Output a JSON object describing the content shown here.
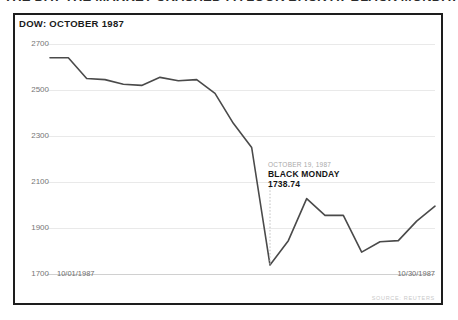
{
  "clipped_headline": "THE DAY THE MARKET CRASHED : A LOOK BACK AT BLACK MONDAY",
  "chart_title": "DOW: OCTOBER 1987",
  "source_credit": "SOURCE: REUTERS",
  "annotation": {
    "date": "OCTOBER 19, 1987",
    "title": "BLACK MONDAY",
    "value": "1738.74"
  },
  "axis": {
    "x_start_label": "10/01/1987",
    "x_end_label": "10/30/1987"
  },
  "colors": {
    "line": "#4a4a4a",
    "frame": "#1d1d1d",
    "grid": "#e9e9e9",
    "tick_text": "#767676",
    "annotation_date": "#a9a9a9",
    "annotation_text": "#151515",
    "source_text": "#c9c9c9"
  },
  "chart_data": {
    "type": "line",
    "title": "DOW: OCTOBER 1987",
    "xlabel": "",
    "ylabel": "",
    "ylim": [
      1700,
      2700
    ],
    "yticks": [
      2700,
      2500,
      2300,
      2100,
      1900,
      1700
    ],
    "grid": true,
    "legend": null,
    "x": [
      "10/01/1987",
      "10/02/1987",
      "10/05/1987",
      "10/06/1987",
      "10/07/1987",
      "10/08/1987",
      "10/09/1987",
      "10/12/1987",
      "10/13/1987",
      "10/14/1987",
      "10/15/1987",
      "10/16/1987",
      "10/19/1987",
      "10/20/1987",
      "10/21/1987",
      "10/22/1987",
      "10/23/1987",
      "10/26/1987",
      "10/27/1987",
      "10/28/1987",
      "10/29/1987",
      "10/30/1987"
    ],
    "values": [
      2640,
      2640,
      2550,
      2545,
      2525,
      2520,
      2555,
      2540,
      2545,
      2485,
      2355,
      2250,
      1739,
      1845,
      2028,
      1955,
      1955,
      1795,
      1840,
      1845,
      1930,
      1995
    ],
    "annotations": [
      {
        "x": "10/19/1987",
        "y": 1738.74,
        "date_label": "OCTOBER 19, 1987",
        "title": "BLACK MONDAY",
        "value_label": "1738.74",
        "marker": "dotted-vertical-line"
      }
    ]
  }
}
